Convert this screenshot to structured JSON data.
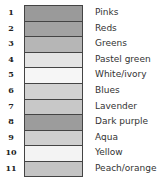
{
  "legend": {
    "items": [
      {
        "number": "1",
        "label": "Pinks",
        "color": "#9a9a9a"
      },
      {
        "number": "2",
        "label": "Reds",
        "color": "#a2a2a2"
      },
      {
        "number": "3",
        "label": "Greens",
        "color": "#b6b6b6"
      },
      {
        "number": "4",
        "label": "Pastel green",
        "color": "#e4e4e4"
      },
      {
        "number": "5",
        "label": "White/ivory",
        "color": "#f6f6f6"
      },
      {
        "number": "6",
        "label": "Blues",
        "color": "#d2d2d2"
      },
      {
        "number": "7",
        "label": "Lavender",
        "color": "#c8c8c8"
      },
      {
        "number": "8",
        "label": "Dark purple",
        "color": "#9c9c9c"
      },
      {
        "number": "9",
        "label": "Aqua",
        "color": "#cfcfcf"
      },
      {
        "number": "10",
        "label": "Yellow",
        "color": "#f3f3f3"
      },
      {
        "number": "11",
        "label": "Peach/orange",
        "color": "#c4c4c4"
      }
    ]
  }
}
